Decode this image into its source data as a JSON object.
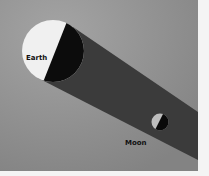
{
  "diagram": {
    "type": "lunar-eclipse-illustration",
    "labels": {
      "earth": "Earth",
      "moon": "Moon"
    },
    "colors": {
      "background": "#8c8c8c",
      "shadow": "#3a3a3a",
      "lit": "#f2f2f2",
      "dark": "#0c0c0c",
      "border": "#f4f4f4"
    }
  }
}
